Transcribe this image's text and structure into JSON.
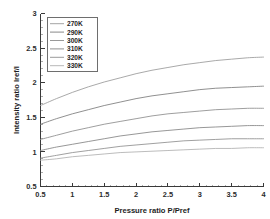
{
  "chart_data": {
    "type": "line",
    "title": "",
    "xlabel": "Pressure ratio P/Pref",
    "ylabel": "Intensity ratio Iref/I",
    "xlim": [
      0.5,
      4
    ],
    "ylim": [
      0.5,
      3
    ],
    "xticks": [
      0.5,
      1,
      1.5,
      2,
      2.5,
      3,
      3.5,
      4
    ],
    "xticklabels": [
      "0.5",
      "1",
      "1.5",
      "2",
      "2.5",
      "3",
      "3.5",
      "4"
    ],
    "yticks": [
      0.5,
      1,
      1.5,
      2,
      2.5,
      3
    ],
    "yticklabels": [
      "0.5",
      "1",
      "1.5",
      "2",
      "2.5",
      "3"
    ],
    "grid": false,
    "legend_position": "upper-left",
    "x": [
      0.5,
      0.75,
      1,
      1.25,
      1.5,
      1.75,
      2,
      2.25,
      2.5,
      2.75,
      3,
      3.25,
      3.5,
      3.75,
      4
    ],
    "series": [
      {
        "name": "270K",
        "color": "#9a9a9a",
        "values": [
          1.67,
          1.77,
          1.86,
          1.94,
          2.01,
          2.07,
          2.13,
          2.18,
          2.22,
          2.26,
          2.29,
          2.32,
          2.34,
          2.36,
          2.37
        ]
      },
      {
        "name": "290K",
        "color": "#7c7c7c",
        "values": [
          1.4,
          1.48,
          1.55,
          1.61,
          1.67,
          1.72,
          1.77,
          1.81,
          1.84,
          1.87,
          1.9,
          1.92,
          1.93,
          1.94,
          1.95
        ]
      },
      {
        "name": "300K",
        "color": "#8d8d8d",
        "values": [
          1.18,
          1.24,
          1.3,
          1.35,
          1.4,
          1.44,
          1.48,
          1.52,
          1.55,
          1.57,
          1.59,
          1.61,
          1.62,
          1.63,
          1.63
        ]
      },
      {
        "name": "310K",
        "color": "#848484",
        "values": [
          1.02,
          1.07,
          1.11,
          1.15,
          1.19,
          1.23,
          1.26,
          1.29,
          1.31,
          1.33,
          1.35,
          1.36,
          1.37,
          1.38,
          1.38
        ]
      },
      {
        "name": "320K",
        "color": "#8f8f8f",
        "values": [
          0.91,
          0.95,
          0.99,
          1.02,
          1.05,
          1.08,
          1.1,
          1.12,
          1.14,
          1.16,
          1.17,
          1.18,
          1.19,
          1.19,
          1.19
        ]
      },
      {
        "name": "330K",
        "color": "#b0b0b0",
        "values": [
          0.88,
          0.9,
          0.93,
          0.95,
          0.97,
          0.99,
          1.0,
          1.01,
          1.02,
          1.03,
          1.04,
          1.05,
          1.05,
          1.06,
          1.06
        ]
      }
    ]
  }
}
